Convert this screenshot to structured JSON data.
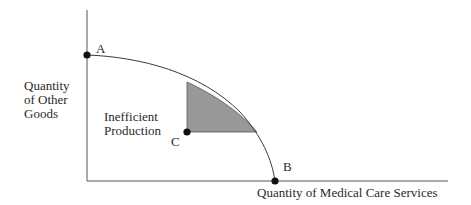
{
  "diagram": {
    "y_axis_label": [
      "Quantity",
      "of Other",
      "Goods"
    ],
    "x_axis_label": "Quantity of Medical Care Services",
    "region_label": [
      "Inefficient",
      "Production"
    ],
    "points": [
      {
        "id": "A",
        "label": "A",
        "x": 87,
        "y": 55
      },
      {
        "id": "B",
        "label": "B",
        "x": 275,
        "y": 181
      },
      {
        "id": "C",
        "label": "C",
        "x": 187,
        "y": 132
      }
    ],
    "colors": {
      "line": "#3a3a3a",
      "shade": "#999999",
      "point": "#111111"
    }
  }
}
